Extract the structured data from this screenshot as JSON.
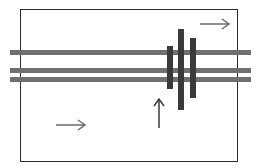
{
  "diagram": {
    "canvas": {
      "width": 266,
      "height": 168,
      "background": "#ffffff"
    },
    "frame": {
      "x": 20,
      "y": 9,
      "width": 218,
      "height": 153,
      "color": "#2a2a2a"
    },
    "horizontal_bars": [
      {
        "id": "h1",
        "x": 10,
        "y": 50,
        "width": 241,
        "height": 5,
        "color": "#707070"
      },
      {
        "id": "h2",
        "x": 10,
        "y": 68,
        "width": 241,
        "height": 5,
        "color": "#707070"
      },
      {
        "id": "h3",
        "x": 10,
        "y": 77,
        "width": 241,
        "height": 5,
        "color": "#707070"
      }
    ],
    "vertical_bars": [
      {
        "id": "v1",
        "x": 167,
        "y": 46,
        "width": 6,
        "height": 43,
        "color": "#3a3a3a"
      },
      {
        "id": "v2",
        "x": 178,
        "y": 29,
        "width": 6,
        "height": 81,
        "color": "#3a3a3a"
      },
      {
        "id": "v3",
        "x": 190,
        "y": 38,
        "width": 6,
        "height": 60,
        "color": "#3a3a3a"
      }
    ],
    "arrows": [
      {
        "id": "arrow-top-right",
        "direction": "right",
        "x1": 200,
        "y1": 24,
        "x2": 229,
        "y2": 24,
        "color": "#6a6a6a"
      },
      {
        "id": "arrow-bottom-left",
        "direction": "right",
        "x1": 56,
        "y1": 125,
        "x2": 85,
        "y2": 125,
        "color": "#6a6a6a"
      },
      {
        "id": "arrow-up",
        "direction": "up",
        "x1": 159,
        "y1": 128,
        "x2": 159,
        "y2": 99,
        "color": "#3a3a3a"
      }
    ]
  }
}
